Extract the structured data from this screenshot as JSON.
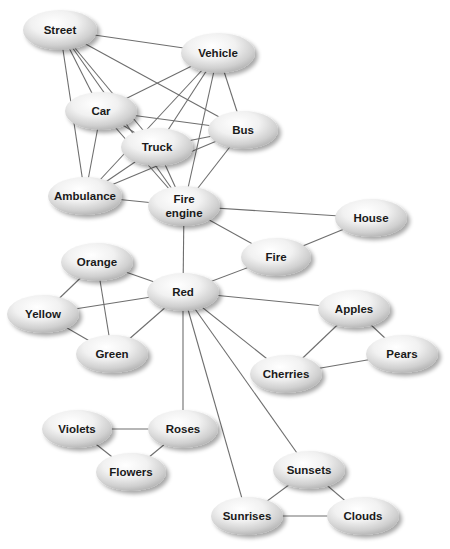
{
  "diagram": {
    "type": "semantic-network",
    "edge_color": "#6e6e6e",
    "node_fill_light": "#ffffff",
    "node_fill_dark": "#b8b8b8",
    "nodes": [
      {
        "id": "street",
        "label": "Street",
        "x": 60,
        "y": 30,
        "rx": 37,
        "ry": 20
      },
      {
        "id": "vehicle",
        "label": "Vehicle",
        "x": 218,
        "y": 53,
        "rx": 37,
        "ry": 20
      },
      {
        "id": "car",
        "label": "Car",
        "x": 101,
        "y": 111,
        "rx": 36,
        "ry": 19
      },
      {
        "id": "bus",
        "label": "Bus",
        "x": 243,
        "y": 130,
        "rx": 35,
        "ry": 19
      },
      {
        "id": "truck",
        "label": "Truck",
        "x": 157,
        "y": 147,
        "rx": 36,
        "ry": 19
      },
      {
        "id": "ambulance",
        "label": "Ambulance",
        "x": 85,
        "y": 196,
        "rx": 37,
        "ry": 19
      },
      {
        "id": "fire-engine",
        "label": "Fire engine",
        "lines": [
          "Fire",
          "engine"
        ],
        "x": 184,
        "y": 206,
        "rx": 36,
        "ry": 20
      },
      {
        "id": "house",
        "label": "House",
        "x": 371,
        "y": 218,
        "rx": 36,
        "ry": 19
      },
      {
        "id": "fire",
        "label": "Fire",
        "x": 276,
        "y": 257,
        "rx": 35,
        "ry": 19
      },
      {
        "id": "orange",
        "label": "Orange",
        "x": 97,
        "y": 262,
        "rx": 36,
        "ry": 19
      },
      {
        "id": "red",
        "label": "Red",
        "x": 183,
        "y": 292,
        "rx": 36,
        "ry": 19
      },
      {
        "id": "yellow",
        "label": "Yellow",
        "x": 43,
        "y": 314,
        "rx": 36,
        "ry": 19
      },
      {
        "id": "apples",
        "label": "Apples",
        "x": 354,
        "y": 309,
        "rx": 36,
        "ry": 19
      },
      {
        "id": "green",
        "label": "Green",
        "x": 112,
        "y": 354,
        "rx": 36,
        "ry": 19
      },
      {
        "id": "pears",
        "label": "Pears",
        "x": 402,
        "y": 354,
        "rx": 36,
        "ry": 19
      },
      {
        "id": "cherries",
        "label": "Cherries",
        "x": 286,
        "y": 374,
        "rx": 36,
        "ry": 19
      },
      {
        "id": "violets",
        "label": "Violets",
        "x": 77,
        "y": 429,
        "rx": 35,
        "ry": 19
      },
      {
        "id": "roses",
        "label": "Roses",
        "x": 183,
        "y": 429,
        "rx": 35,
        "ry": 19
      },
      {
        "id": "flowers",
        "label": "Flowers",
        "x": 131,
        "y": 472,
        "rx": 35,
        "ry": 19
      },
      {
        "id": "sunsets",
        "label": "Sunsets",
        "x": 309,
        "y": 470,
        "rx": 36,
        "ry": 19
      },
      {
        "id": "sunrises",
        "label": "Sunrises",
        "x": 247,
        "y": 516,
        "rx": 36,
        "ry": 19
      },
      {
        "id": "clouds",
        "label": "Clouds",
        "x": 363,
        "y": 516,
        "rx": 36,
        "ry": 19
      }
    ],
    "edges": [
      [
        "street",
        "vehicle"
      ],
      [
        "street",
        "car"
      ],
      [
        "street",
        "truck"
      ],
      [
        "street",
        "bus"
      ],
      [
        "street",
        "ambulance"
      ],
      [
        "street",
        "fire-engine"
      ],
      [
        "vehicle",
        "car"
      ],
      [
        "vehicle",
        "truck"
      ],
      [
        "vehicle",
        "bus"
      ],
      [
        "vehicle",
        "ambulance"
      ],
      [
        "vehicle",
        "fire-engine"
      ],
      [
        "car",
        "bus"
      ],
      [
        "car",
        "truck"
      ],
      [
        "car",
        "ambulance"
      ],
      [
        "car",
        "fire-engine"
      ],
      [
        "truck",
        "bus"
      ],
      [
        "truck",
        "ambulance"
      ],
      [
        "truck",
        "fire-engine"
      ],
      [
        "bus",
        "ambulance"
      ],
      [
        "bus",
        "fire-engine"
      ],
      [
        "ambulance",
        "fire-engine"
      ],
      [
        "fire-engine",
        "house"
      ],
      [
        "fire-engine",
        "fire"
      ],
      [
        "fire-engine",
        "red"
      ],
      [
        "house",
        "fire"
      ],
      [
        "fire",
        "red"
      ],
      [
        "red",
        "orange"
      ],
      [
        "red",
        "yellow"
      ],
      [
        "red",
        "green"
      ],
      [
        "orange",
        "yellow"
      ],
      [
        "orange",
        "green"
      ],
      [
        "yellow",
        "green"
      ],
      [
        "red",
        "apples"
      ],
      [
        "red",
        "cherries"
      ],
      [
        "red",
        "roses"
      ],
      [
        "red",
        "sunrises"
      ],
      [
        "red",
        "sunsets"
      ],
      [
        "apples",
        "pears"
      ],
      [
        "apples",
        "cherries"
      ],
      [
        "cherries",
        "pears"
      ],
      [
        "violets",
        "roses"
      ],
      [
        "violets",
        "flowers"
      ],
      [
        "roses",
        "flowers"
      ],
      [
        "sunsets",
        "sunrises"
      ],
      [
        "sunsets",
        "clouds"
      ],
      [
        "sunrises",
        "clouds"
      ]
    ]
  }
}
